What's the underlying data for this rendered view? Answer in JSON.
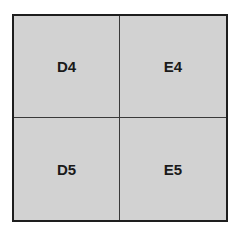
{
  "grid": {
    "cells": [
      {
        "label": "D4"
      },
      {
        "label": "E4"
      },
      {
        "label": "D5"
      },
      {
        "label": "E5"
      }
    ],
    "fill_color": "#d2d2d2",
    "border_color": "#1e1e1e"
  }
}
